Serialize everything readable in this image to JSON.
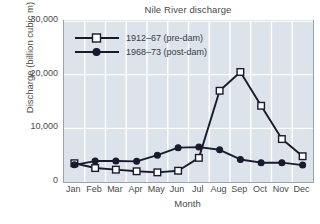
{
  "chart_data": {
    "type": "line",
    "title": "Nile River discharge",
    "xlabel": "Month",
    "ylabel": "Discharge (billion cubic m)",
    "categories": [
      "Jan",
      "Feb",
      "Mar",
      "Apr",
      "May",
      "Jun",
      "Jul",
      "Aug",
      "Sep",
      "Oct",
      "Nov",
      "Dec"
    ],
    "ylim": [
      0,
      30000
    ],
    "yticks": [
      "0",
      "10,000",
      "20,000",
      "30,000"
    ],
    "ytick_values": [
      0,
      10000,
      20000,
      30000
    ],
    "grid": true,
    "legend_position": "upper-left-inside",
    "series": [
      {
        "name": "1912–67 (pre-dam)",
        "marker": "open-square",
        "color": "#1a1a2e",
        "values": [
          3500,
          2600,
          2300,
          2000,
          1800,
          2100,
          4500,
          17000,
          20500,
          14200,
          8000,
          4800
        ]
      },
      {
        "name": "1968–73 (post-dam)",
        "marker": "filled-circle",
        "color": "#1a1a2e",
        "values": [
          3200,
          3900,
          3900,
          3850,
          5000,
          6400,
          6500,
          6000,
          4200,
          3600,
          3600,
          3150
        ]
      }
    ],
    "style": {
      "plot_background": "#dde3ea",
      "gridline_color": "#ffffff",
      "frame_color": "#9aa3ad",
      "page_background": "#ffffff",
      "text_color": "#4a4a4a"
    }
  }
}
